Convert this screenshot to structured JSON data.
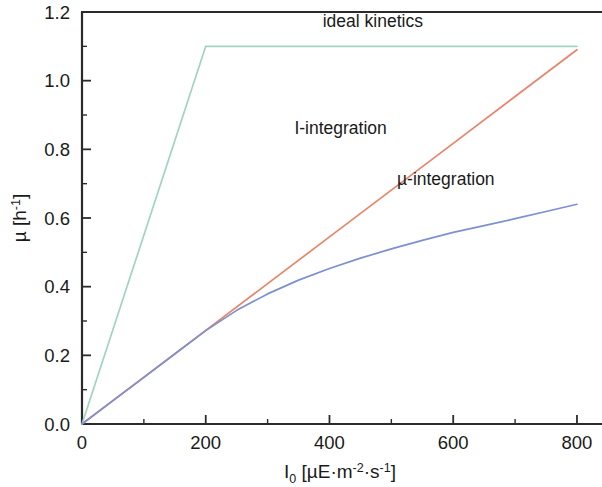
{
  "chart_data": {
    "type": "line",
    "title": "",
    "xlabel": "I_0 [µE·m⁻²·s⁻¹]",
    "ylabel": "µ [h⁻¹]",
    "xlim": [
      0,
      834
    ],
    "ylim": [
      0.0,
      1.2
    ],
    "grid": false,
    "legend_position": "inline-annotations",
    "x_ticks_major": [
      0,
      200,
      400,
      600,
      800
    ],
    "x_tick_labels": [
      "0",
      "200",
      "400",
      "600",
      "800"
    ],
    "x_ticks_minor": [
      100,
      300,
      500,
      700
    ],
    "y_ticks_major": [
      0.0,
      0.2,
      0.4,
      0.6,
      0.8,
      1.0,
      1.2
    ],
    "y_tick_labels": [
      "0.0",
      "0.2",
      "0.4",
      "0.6",
      "0.8",
      "1.0",
      "1.2"
    ],
    "y_ticks_minor": [
      0.1,
      0.3,
      0.5,
      0.7,
      0.9,
      1.1
    ],
    "series": [
      {
        "name": "ideal kinetics",
        "color": "#9fd5bf",
        "label_x": 470,
        "label_y": 1.155,
        "x": [
          0,
          200,
          800
        ],
        "y": [
          0.0,
          1.1,
          1.1
        ]
      },
      {
        "name": "I-integration",
        "color": "#e8846b",
        "label_x": 418,
        "label_y": 0.845,
        "x": [
          0,
          100,
          200,
          300,
          400,
          500,
          600,
          700,
          800
        ],
        "y": [
          0.0,
          0.1363,
          0.2725,
          0.4088,
          0.545,
          0.6813,
          0.8175,
          0.9538,
          1.09
        ]
      },
      {
        "name": "µ-integration",
        "color": "#7d90d2",
        "label_x": 588,
        "label_y": 0.695,
        "x": [
          0,
          50,
          100,
          150,
          200,
          250,
          300,
          350,
          400,
          450,
          500,
          550,
          600,
          650,
          700,
          750,
          800
        ],
        "y": [
          0.0,
          0.068,
          0.136,
          0.204,
          0.272,
          0.331,
          0.379,
          0.419,
          0.453,
          0.483,
          0.51,
          0.535,
          0.558,
          0.578,
          0.598,
          0.619,
          0.64
        ]
      }
    ]
  },
  "axis_titles": {
    "x_main": "I",
    "x_sub": "0",
    "x_bracket_open": " [µE·m",
    "x_sup1": "-2",
    "x_mid": "·s",
    "x_sup2": "-1",
    "x_bracket_close": "]",
    "y_main": "µ  [h",
    "y_sup": "-1",
    "y_close": "]"
  },
  "annotations": {
    "ideal": "ideal kinetics",
    "i_integration": "I-integration",
    "mu_integration": "µ-integration"
  },
  "colors": {
    "ideal": "#9fd5bf",
    "i_integration": "#e8846b",
    "mu_integration": "#7d90d2",
    "axis": "#2b2b2b",
    "text": "#1a1a1a",
    "background": "#ffffff"
  }
}
